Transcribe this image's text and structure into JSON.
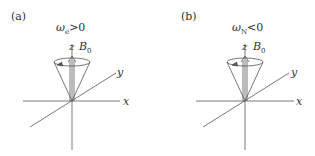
{
  "panels": [
    {
      "id": "a",
      "label": "(a)",
      "condition": "ω",
      "condition_sub": "e",
      "condition_rel": ">0",
      "axes": {
        "x": "x",
        "y": "y",
        "z": "z"
      },
      "field": "B",
      "field_sub": "0",
      "precession_arrow": "left"
    },
    {
      "id": "b",
      "label": "(b)",
      "condition": "ω",
      "condition_sub": "N",
      "condition_rel": "<0",
      "axes": {
        "x": "x",
        "y": "y",
        "z": "z"
      },
      "field": "B",
      "field_sub": "0",
      "precession_arrow": "left"
    }
  ],
  "colors": {
    "line": "#555555",
    "text": "#333333"
  }
}
